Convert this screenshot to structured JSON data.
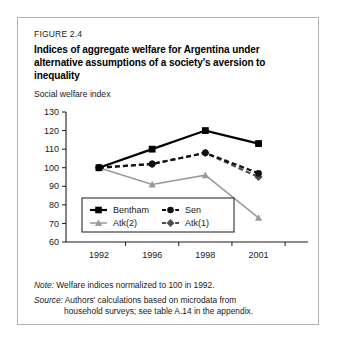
{
  "figure": {
    "number": "FIGURE 2.4",
    "title": "Indices of aggregate welfare for Argentina under alternative assumptions of a society's aversion to inequality"
  },
  "notes": {
    "note_lead": "Note:",
    "note_text": "Welfare indices normalized to 100 in 1992.",
    "source_lead": "Source:",
    "source_text": "Authors' calculations based on microdata from",
    "source_text2": "household surveys; see table A.14 in the appendix."
  },
  "colors": {
    "bentham": "#000000",
    "sen": "#111111",
    "atk2": "#9a9a9a",
    "atk1": "#4d4d4d",
    "frame": "#b3b3b3",
    "axis": "#1a1a1a"
  },
  "chart_data": {
    "type": "line",
    "title": "Indices of aggregate welfare for Argentina under alternative assumptions of a society's aversion to inequality",
    "xlabel": "",
    "ylabel": "Social welfare index",
    "categories": [
      "1992",
      "1996",
      "1998",
      "2001"
    ],
    "ylim": [
      60,
      130
    ],
    "yticks": [
      60,
      70,
      80,
      90,
      100,
      110,
      120,
      130
    ],
    "grid": false,
    "legend_position": "inside-bottom-left",
    "series": [
      {
        "name": "Bentham",
        "values": [
          100,
          110,
          120,
          113
        ],
        "color": "#000000",
        "dash": "solid",
        "marker": "square"
      },
      {
        "name": "Sen",
        "values": [
          100,
          102,
          108,
          97
        ],
        "color": "#111111",
        "dash": "dashed",
        "marker": "circle"
      },
      {
        "name": "Atk(2)",
        "values": [
          100,
          91,
          96,
          73
        ],
        "color": "#9a9a9a",
        "dash": "solid",
        "marker": "triangle"
      },
      {
        "name": "Atk(1)",
        "values": [
          100,
          102,
          108,
          95
        ],
        "color": "#4d4d4d",
        "dash": "dashed",
        "marker": "diamond"
      }
    ]
  }
}
